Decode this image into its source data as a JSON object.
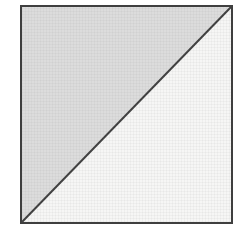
{
  "figure": {
    "colors": {
      "background": "#ffffff",
      "shaded_triangle": "#dcdcdc",
      "unshaded_triangle": "#f6f6f5",
      "outline": "#3f3f3f"
    }
  }
}
